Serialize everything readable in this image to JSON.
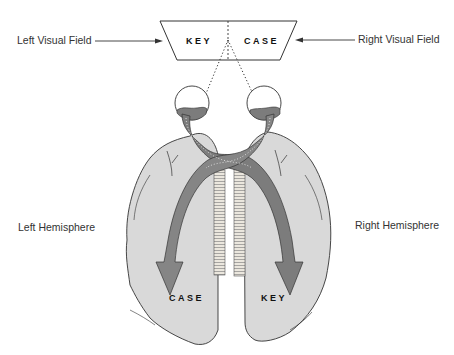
{
  "labels": {
    "left_visual_field": "Left Visual Field",
    "right_visual_field": "Right Visual Field",
    "left_hemisphere": "Left Hemisphere",
    "right_hemisphere": "Right Hemisphere"
  },
  "screen": {
    "left_word": "KEY",
    "right_word": "CASE"
  },
  "hemisphere_words": {
    "left": "CASE",
    "right": "KEY"
  },
  "colors": {
    "brain_fill": "#d9d9d9",
    "pathway": "#7c7c7c",
    "outline": "#333333",
    "corpus_callosum": "#e8e4dc"
  }
}
